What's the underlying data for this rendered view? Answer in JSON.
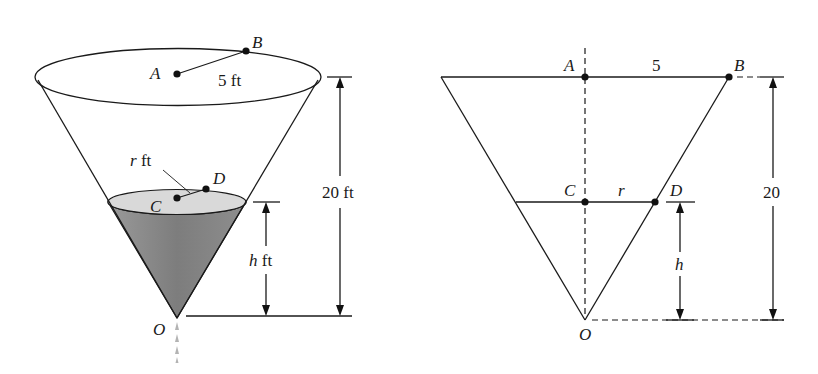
{
  "figure": {
    "left": {
      "title": "3D conical tank",
      "labels": {
        "A": "A",
        "B": "B",
        "C": "C",
        "D": "D",
        "O": "O",
        "top_radius": "5 ft",
        "water_radius_var": "r",
        "water_radius_unit": " ft",
        "height_total": "20 ft",
        "water_height_var": "h",
        "water_height_unit": " ft"
      },
      "colors": {
        "water_fill": "#8a8a8a",
        "water_surface": "#d6d6d6",
        "drop": "#b0b0b0"
      }
    },
    "right": {
      "title": "Cross-section",
      "labels": {
        "A": "A",
        "B": "B",
        "C": "C",
        "D": "D",
        "O": "O",
        "top_radius": "5",
        "water_radius": "r",
        "height_total": "20",
        "water_height": "h"
      }
    }
  }
}
